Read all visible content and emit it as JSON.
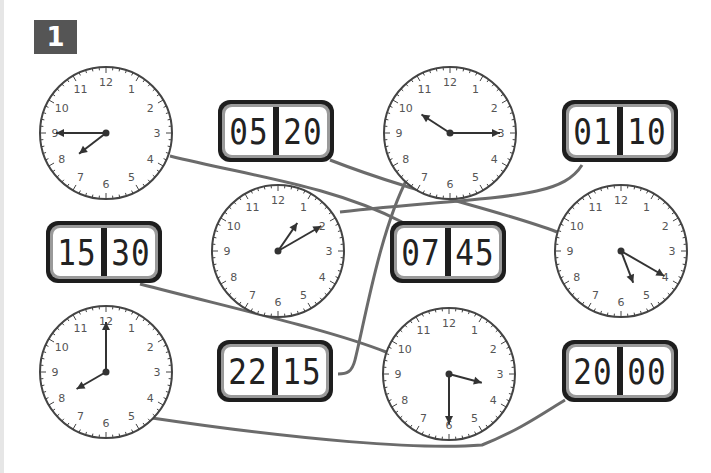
{
  "exercise": {
    "number": "1"
  },
  "analog_clocks": [
    {
      "id": "clock-a",
      "hour_hand_points_to": 7.75,
      "minute_hand_points_to": 9,
      "reads": "7:45"
    },
    {
      "id": "clock-b",
      "hour_hand_points_to": 10.1,
      "minute_hand_points_to": 3,
      "reads": "10:15"
    },
    {
      "id": "clock-c",
      "hour_hand_points_to": 1.15,
      "minute_hand_points_to": 2,
      "reads": "1:10"
    },
    {
      "id": "clock-d",
      "hour_hand_points_to": 5.3,
      "minute_hand_points_to": 4,
      "reads": "5:20"
    },
    {
      "id": "clock-e",
      "hour_hand_points_to": 8,
      "minute_hand_points_to": 12,
      "reads": "8:00"
    },
    {
      "id": "clock-f",
      "hour_hand_points_to": 3.5,
      "minute_hand_points_to": 6,
      "reads": "3:30"
    }
  ],
  "digital_clocks": [
    {
      "id": "digital-0520",
      "hours": "05",
      "minutes": "20"
    },
    {
      "id": "digital-0110",
      "hours": "01",
      "minutes": "10"
    },
    {
      "id": "digital-1530",
      "hours": "15",
      "minutes": "30"
    },
    {
      "id": "digital-0745",
      "hours": "07",
      "minutes": "45"
    },
    {
      "id": "digital-2215",
      "hours": "22",
      "minutes": "15"
    },
    {
      "id": "digital-2000",
      "hours": "20",
      "minutes": "00"
    }
  ],
  "dial_numbers": [
    "12",
    "1",
    "2",
    "3",
    "4",
    "5",
    "6",
    "7",
    "8",
    "9",
    "10",
    "11"
  ],
  "colors": {
    "line": "#6b6b6b",
    "clock_outline": "#444444",
    "badge": "#555555"
  }
}
